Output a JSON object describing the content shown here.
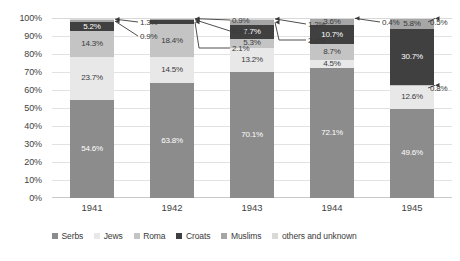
{
  "chart_data": {
    "type": "bar",
    "subtype": "stacked-bar-100-percent",
    "title": "",
    "subtitle": "",
    "xlabel": "",
    "ylabel": "",
    "categories": [
      "1941",
      "1942",
      "1943",
      "1944",
      "1945"
    ],
    "ylim": [
      0,
      100
    ],
    "ytick_labels": [
      "0%",
      "10%",
      "20%",
      "30%",
      "40%",
      "50%",
      "60%",
      "70%",
      "80%",
      "90%",
      "100%"
    ],
    "ytick_values": [
      0,
      10,
      20,
      30,
      40,
      50,
      60,
      70,
      80,
      90,
      100
    ],
    "grid": true,
    "legend_position": "bottom",
    "stack_order_bottom_to_top": [
      "Serbs",
      "Jews",
      "Roma",
      "Croats",
      "Muslims",
      "others and unknown"
    ],
    "series": [
      {
        "name": "Serbs",
        "color": "#8c8c8c",
        "values": [
          54.6,
          63.8,
          70.1,
          72.1,
          49.6
        ],
        "labels": [
          "54.6%",
          "63.8%",
          "70.1%",
          "72.1%",
          "49.6%"
        ]
      },
      {
        "name": "Jews",
        "color": "#e8e8e8",
        "values": [
          23.7,
          14.5,
          13.2,
          4.5,
          12.6
        ],
        "labels": [
          "23.7%",
          "14.5%",
          "13.2%",
          "4.5%",
          "12.6%"
        ]
      },
      {
        "name": "Roma",
        "color": "#c4c4c4",
        "values": [
          14.3,
          18.4,
          5.3,
          8.7,
          0.8
        ],
        "labels": [
          "14.3%",
          "18.4%",
          "5.3%",
          "8.7%",
          "0.8%"
        ]
      },
      {
        "name": "Croats",
        "color": "#404040",
        "values": [
          5.2,
          2.1,
          7.7,
          10.7,
          30.7
        ],
        "labels": [
          "5.2%",
          "2.1%",
          "7.7%",
          "10.7%",
          "30.7%"
        ]
      },
      {
        "name": "Muslims",
        "color": "#a6a6a6",
        "values": [
          0.9,
          0.4,
          2.6,
          3.6,
          5.8
        ],
        "labels": [
          "0.9%",
          "0.4%",
          "2.6%",
          "3.6%",
          "5.8%"
        ]
      },
      {
        "name": "others and unknown",
        "color": "#d9d9d9",
        "values": [
          1.3,
          0.9,
          1.2,
          0.4,
          0.5
        ],
        "labels": [
          "1.3%",
          "0.9%",
          "1.2%",
          "0.4%",
          "0.5%"
        ]
      }
    ],
    "callout_annotations": [
      {
        "category": "1941",
        "series": "others and unknown",
        "text": "1.3%"
      },
      {
        "category": "1941",
        "series": "Muslims",
        "text": "0.9%"
      },
      {
        "category": "1942",
        "series": "others and unknown",
        "text": "0.9%"
      },
      {
        "category": "1942",
        "series": "Muslims",
        "text": "0.4%"
      },
      {
        "category": "1942",
        "series": "Croats",
        "text": "2.1%"
      },
      {
        "category": "1943",
        "series": "others and unknown",
        "text": "1.2%"
      },
      {
        "category": "1943",
        "series": "Muslims",
        "text": "2.6%"
      },
      {
        "category": "1944",
        "series": "others and unknown",
        "text": "0.4%"
      },
      {
        "category": "1945",
        "series": "others and unknown",
        "text": "0.5%"
      },
      {
        "category": "1945",
        "series": "Roma",
        "text": "0.8%"
      }
    ]
  },
  "legend": {
    "items": [
      {
        "label": "Serbs",
        "color": "#8c8c8c"
      },
      {
        "label": "Jews",
        "color": "#e8e8e8"
      },
      {
        "label": "Roma",
        "color": "#c4c4c4"
      },
      {
        "label": "Croats",
        "color": "#404040"
      },
      {
        "label": "Muslims",
        "color": "#a6a6a6"
      },
      {
        "label": "others and unknown",
        "color": "#d9d9d9"
      }
    ]
  },
  "colors": {
    "gridline": "#e2e2e2",
    "text": "#3f3f3f",
    "background": "#ffffff",
    "callout_line": "#3a3a3a"
  }
}
